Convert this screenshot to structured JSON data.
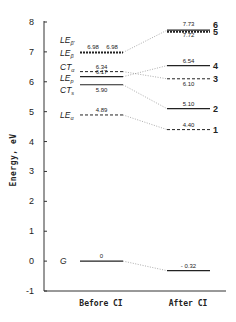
{
  "chart_data": {
    "type": "energy-level-diagram",
    "title": "",
    "ylabel": "Energy, eV",
    "ylim": [
      -1,
      8
    ],
    "yticks": [
      8,
      7,
      6,
      5,
      4,
      3,
      2,
      1,
      0,
      -1
    ],
    "categories": [
      "Before CI",
      "After CI"
    ],
    "before": [
      {
        "id": "LEb2",
        "label": "LE",
        "sub": "β'",
        "value": 6.98,
        "value_label": "6.98",
        "style": "bold-dashed"
      },
      {
        "id": "LEb1",
        "label": "LE",
        "sub": "β",
        "value": 6.98,
        "value_label": "6.98",
        "style": "bold-dashed"
      },
      {
        "id": "CTa",
        "label": "CT",
        "sub": "α",
        "value": 6.34,
        "value_label": "6.34",
        "style": "dashed"
      },
      {
        "id": "LEp",
        "label": "LE",
        "sub": "p",
        "value": 6.17,
        "value_label": "6.17",
        "style": "solid"
      },
      {
        "id": "CTs",
        "label": "CT",
        "sub": "s",
        "value": 5.9,
        "value_label": "5.90",
        "style": "solid"
      },
      {
        "id": "LEa",
        "label": "LE",
        "sub": "α",
        "value": 4.89,
        "value_label": "4.89",
        "style": "dashed"
      },
      {
        "id": "G",
        "label": "G",
        "sub": "",
        "value": 0,
        "value_label": "0",
        "style": "solid"
      }
    ],
    "after": [
      {
        "id": "s6",
        "number": "6",
        "value": 7.73,
        "value_label": "7.73",
        "style": "solid"
      },
      {
        "id": "s5",
        "number": "5",
        "value": 7.72,
        "value_label": "7.72",
        "style": "bold-dashed"
      },
      {
        "id": "s4",
        "number": "4",
        "value": 6.54,
        "value_label": "6.54",
        "style": "solid"
      },
      {
        "id": "s3",
        "number": "3",
        "value": 6.1,
        "value_label": "6.10",
        "style": "dashed"
      },
      {
        "id": "s2",
        "number": "2",
        "value": 5.1,
        "value_label": "5.10",
        "style": "solid"
      },
      {
        "id": "s1",
        "number": "1",
        "value": 4.4,
        "value_label": "4.40",
        "style": "dashed"
      },
      {
        "id": "g",
        "number": "",
        "value": -0.32,
        "value_label": "- 0.32",
        "style": "solid"
      }
    ],
    "correlations": [
      {
        "from": 6.98,
        "to": 7.725
      },
      {
        "from": 6.34,
        "to": 6.1
      },
      {
        "from": 6.17,
        "to": 6.54
      },
      {
        "from": 5.9,
        "to": 5.1
      },
      {
        "from": 4.89,
        "to": 4.4
      },
      {
        "from": 0,
        "to": -0.32
      }
    ]
  }
}
